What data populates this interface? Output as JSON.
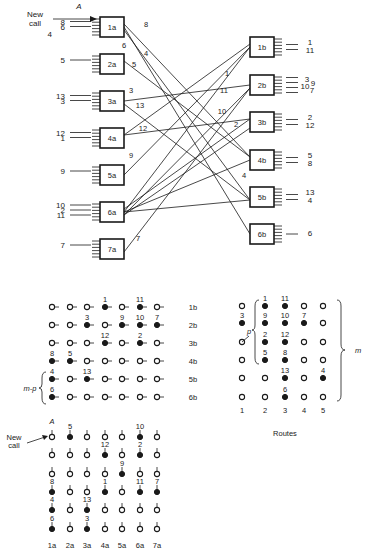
{
  "network": {
    "arrival_label": "A",
    "new_call_label_line1": "New",
    "new_call_label_line2": "call",
    "a_switches": [
      {
        "id": "1a",
        "inputs": [
          "8",
          "6"
        ],
        "input_side_extra": "4",
        "outputs": [
          "8",
          "6",
          "4"
        ]
      },
      {
        "id": "2a",
        "inputs": [
          "5"
        ],
        "outputs": [
          "5"
        ]
      },
      {
        "id": "3a",
        "inputs": [
          "13",
          "3"
        ],
        "outputs": [
          "3",
          "13"
        ]
      },
      {
        "id": "4a",
        "inputs": [
          "12",
          "1"
        ],
        "outputs": [
          "12"
        ]
      },
      {
        "id": "5a",
        "inputs": [
          "9"
        ],
        "outputs": [
          "9"
        ]
      },
      {
        "id": "6a",
        "inputs": [
          "10",
          "2",
          "11"
        ],
        "outputs": []
      },
      {
        "id": "7a",
        "inputs": [
          "7"
        ],
        "outputs": [
          "7"
        ]
      }
    ],
    "b_switches": [
      {
        "id": "1b",
        "outputs": [
          "1",
          "11"
        ]
      },
      {
        "id": "2b",
        "outputs": [
          "3",
          "9",
          "10",
          "7"
        ]
      },
      {
        "id": "3b",
        "outputs": [
          "2",
          "12"
        ]
      },
      {
        "id": "4b",
        "outputs": [
          "5",
          "8"
        ]
      },
      {
        "id": "5b",
        "outputs": [
          "13",
          "4"
        ]
      },
      {
        "id": "6b",
        "outputs": [
          "6"
        ]
      }
    ],
    "link_labels": [
      "8",
      "6",
      "4",
      "5",
      "3",
      "13",
      "12",
      "9",
      "7",
      "1",
      "11",
      "10",
      "2",
      "4"
    ]
  },
  "matrix_left": {
    "b_rows": [
      "1b",
      "2b",
      "3b",
      "4b",
      "5b",
      "6b"
    ],
    "a_cols": [
      "1a",
      "2a",
      "3a",
      "4a",
      "5a",
      "6a",
      "7a"
    ],
    "brace_label": "m-p",
    "arrival_label": "A",
    "new_call_label_line1": "New",
    "new_call_label_line2": "call",
    "top_grid": [
      [
        "",
        "",
        "",
        "1",
        "",
        "11",
        ""
      ],
      [
        "",
        "",
        "3",
        "",
        "9",
        "10",
        "7"
      ],
      [
        "",
        "",
        "",
        "12",
        "",
        "2",
        ""
      ],
      [
        "8",
        "5",
        "",
        "",
        "",
        "",
        ""
      ],
      [
        "4",
        "",
        "13",
        "",
        "",
        "",
        ""
      ],
      [
        "6",
        "",
        "",
        "",
        "",
        "",
        ""
      ]
    ],
    "bottom_grid": [
      [
        "",
        "5",
        "",
        "",
        "",
        "10",
        ""
      ],
      [
        "",
        "",
        "",
        "12",
        "",
        "2",
        ""
      ],
      [
        "",
        "",
        "",
        "",
        "9",
        "",
        ""
      ],
      [
        "8",
        "",
        "",
        "1",
        "",
        "11",
        "7"
      ],
      [
        "4",
        "",
        "13",
        "",
        "",
        "",
        ""
      ],
      [
        "6",
        "",
        "3",
        "",
        "",
        "",
        ""
      ]
    ]
  },
  "matrix_routes": {
    "title": "Routes",
    "col_labels": [
      "1",
      "2",
      "3",
      "4",
      "5"
    ],
    "brace_p_label": "p",
    "brace_m_label": "m",
    "grid": [
      [
        "",
        "1",
        "11",
        "",
        ""
      ],
      [
        "3",
        "9",
        "10",
        "7",
        ""
      ],
      [
        "",
        "2",
        "12",
        "",
        ""
      ],
      [
        "",
        "5",
        "8",
        "",
        ""
      ],
      [
        "",
        "",
        "13",
        "",
        "4"
      ],
      [
        "",
        "",
        "6",
        "",
        ""
      ]
    ]
  },
  "caption_partial": "16  Blocking in a one-sided network"
}
